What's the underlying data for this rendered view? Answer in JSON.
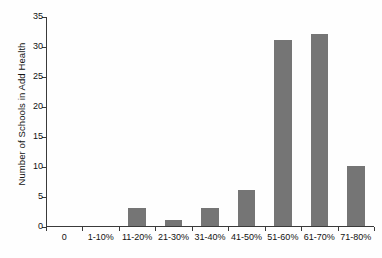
{
  "chart_data": {
    "type": "bar",
    "title": "",
    "subtitle": "",
    "xlabel": "",
    "ylabel": "Number of Schools in Add Health",
    "categories": [
      "0",
      "1-10%",
      "11-20%",
      "21-30%",
      "31-40%",
      "41-50%",
      "51-60%",
      "61-70%",
      "71-80%"
    ],
    "values": [
      0,
      0,
      3,
      1,
      3,
      6,
      31,
      32,
      10
    ],
    "ylim": [
      0,
      35
    ],
    "ytick_values": [
      0,
      5,
      10,
      15,
      20,
      25,
      30,
      35
    ],
    "ytick_labels": [
      "0",
      "5",
      "10",
      "15",
      "20",
      "25",
      "30",
      "35"
    ],
    "grid": false,
    "legend": null,
    "bar_color": "#757575",
    "axis_color": "#3a3a3a",
    "background_color": "#fefefe",
    "text_color": "#111111"
  }
}
